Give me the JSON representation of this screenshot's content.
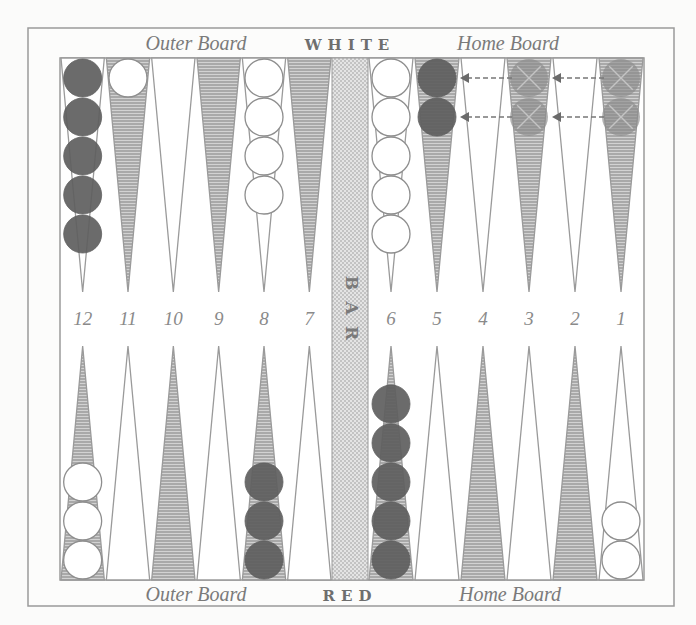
{
  "board": {
    "top": {
      "left_label": "Outer Board",
      "center_label": "WHITE",
      "right_label": "Home Board"
    },
    "bottom": {
      "left_label": "Outer Board",
      "center_label": "RED",
      "right_label": "Home Board"
    },
    "bar_label": "BAR",
    "point_numbers": [
      "12",
      "11",
      "10",
      "9",
      "8",
      "7",
      "6",
      "5",
      "4",
      "3",
      "2",
      "1"
    ]
  },
  "colors": {
    "frame": "#9a9a9a",
    "hatched_point": "#a8a8a8",
    "white_checker": "#ffffff",
    "red_checker": "#6a6a6a",
    "ghost_checker": "#9a9a9a",
    "bar_fill": "#d6d6d6",
    "arrow": "#777777"
  },
  "position": {
    "top": [
      {
        "point": "12",
        "shade": "light",
        "checkers": {
          "color": "red",
          "count": 5
        }
      },
      {
        "point": "11",
        "shade": "dark",
        "checkers": {
          "color": "white",
          "count": 1
        }
      },
      {
        "point": "10",
        "shade": "light",
        "checkers": {
          "color": "none",
          "count": 0
        }
      },
      {
        "point": "9",
        "shade": "dark",
        "checkers": {
          "color": "none",
          "count": 0
        }
      },
      {
        "point": "8",
        "shade": "light",
        "checkers": {
          "color": "white",
          "count": 4
        }
      },
      {
        "point": "7",
        "shade": "dark",
        "checkers": {
          "color": "none",
          "count": 0
        }
      },
      {
        "point": "6",
        "shade": "light",
        "checkers": {
          "color": "white",
          "count": 5
        }
      },
      {
        "point": "5",
        "shade": "dark",
        "checkers": {
          "color": "red",
          "count": 2
        }
      },
      {
        "point": "4",
        "shade": "light",
        "checkers": {
          "color": "none",
          "count": 0
        }
      },
      {
        "point": "3",
        "shade": "dark",
        "checkers": {
          "color": "ghost",
          "count": 2
        }
      },
      {
        "point": "2",
        "shade": "light",
        "checkers": {
          "color": "none",
          "count": 0
        }
      },
      {
        "point": "1",
        "shade": "dark",
        "checkers": {
          "color": "ghost",
          "count": 2
        }
      }
    ],
    "bottom": [
      {
        "point": "12",
        "shade": "dark",
        "checkers": {
          "color": "white",
          "count": 3
        }
      },
      {
        "point": "11",
        "shade": "light",
        "checkers": {
          "color": "none",
          "count": 0
        }
      },
      {
        "point": "10",
        "shade": "dark",
        "checkers": {
          "color": "none",
          "count": 0
        }
      },
      {
        "point": "9",
        "shade": "light",
        "checkers": {
          "color": "none",
          "count": 0
        }
      },
      {
        "point": "8",
        "shade": "dark",
        "checkers": {
          "color": "red",
          "count": 3
        }
      },
      {
        "point": "7",
        "shade": "light",
        "checkers": {
          "color": "none",
          "count": 0
        }
      },
      {
        "point": "6",
        "shade": "dark",
        "checkers": {
          "color": "red",
          "count": 5
        }
      },
      {
        "point": "5",
        "shade": "light",
        "checkers": {
          "color": "none",
          "count": 0
        }
      },
      {
        "point": "4",
        "shade": "dark",
        "checkers": {
          "color": "none",
          "count": 0
        }
      },
      {
        "point": "3",
        "shade": "light",
        "checkers": {
          "color": "none",
          "count": 0
        }
      },
      {
        "point": "2",
        "shade": "dark",
        "checkers": {
          "color": "none",
          "count": 0
        }
      },
      {
        "point": "1",
        "shade": "light",
        "checkers": {
          "color": "white",
          "count": 2
        }
      }
    ],
    "moves": [
      {
        "from": "1",
        "to": "3",
        "row": 1
      },
      {
        "from": "1",
        "to": "3",
        "row": 2
      },
      {
        "from": "3",
        "to": "5",
        "row": 1
      },
      {
        "from": "3",
        "to": "5",
        "row": 2
      }
    ]
  }
}
